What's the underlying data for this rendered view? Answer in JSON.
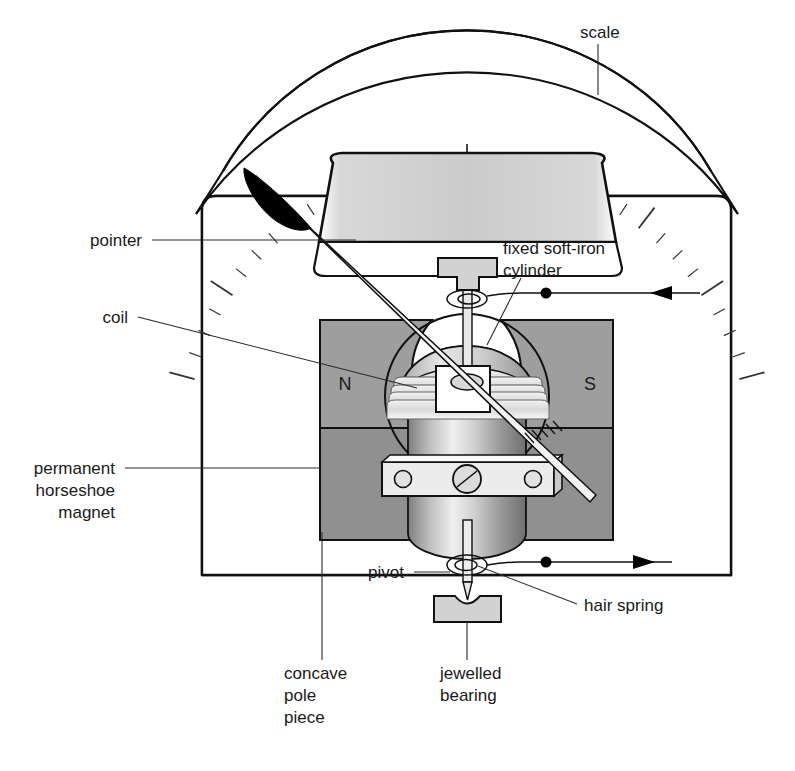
{
  "figure": {
    "background": "#ffffff",
    "line_color": "#111111",
    "magnet_fill": "#9a9a9a",
    "magnet_fill_lower": "#909090",
    "body_fill": "#cfcfcf",
    "pointer_fill": "#000000"
  },
  "labels": {
    "scale": "scale",
    "pointer": "pointer",
    "coil": "coil",
    "permanent_magnet_line1": "permanent",
    "permanent_magnet_line2": "horseshoe",
    "permanent_magnet_line3": "magnet",
    "fixed_cylinder_line1": "fixed soft-iron",
    "fixed_cylinder_line2": "cylinder",
    "pivot": "pivot",
    "hair_spring": "hair spring",
    "jewelled_bearing_line1": "jewelled",
    "jewelled_bearing_line2": "bearing",
    "concave_pole_line1": "concave",
    "concave_pole_line2": "pole",
    "concave_pole_line3": "piece",
    "pole_north": "N",
    "pole_south": "S"
  },
  "icons": {
    "current_in_arrow": "arrow-left-icon",
    "current_out_arrow": "arrow-right-icon",
    "terminal_dot_top": "terminal-dot-icon",
    "terminal_dot_bottom": "terminal-dot-icon",
    "pointer_needle": "pointer-needle-icon",
    "screw_head": "screw-icon",
    "spring_coil_top": "hairspring-coil-icon",
    "spring_coil_bottom": "hairspring-coil-icon"
  },
  "scale_arc": {
    "major_ticks": 9,
    "minor_ticks_per_major": 4,
    "span_degrees": 150,
    "tick_color": "#333333"
  }
}
